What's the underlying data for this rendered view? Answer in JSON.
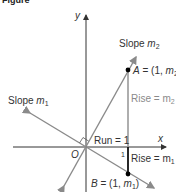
{
  "figure": {
    "caption_partial": "Figure",
    "axes": {
      "x_label": "x",
      "y_label": "y",
      "origin_label": "O"
    },
    "lines": [
      {
        "name": "line-m2",
        "label": "Slope m",
        "label_sub": "2",
        "color": "#8a8a8a"
      },
      {
        "name": "line-m1",
        "label": "Slope m",
        "label_sub": "1",
        "color": "#8a8a8a"
      }
    ],
    "points": {
      "A": {
        "label": "A = (1, m",
        "sub": "2",
        "close": ")"
      },
      "B": {
        "label": "B = (1, m",
        "sub": "1",
        "close": ")"
      }
    },
    "annotations": {
      "run": "Run = 1",
      "rise2": "Rise = m",
      "rise2_sub": "2",
      "rise1": "Rise = m",
      "rise1_sub": "1",
      "tick_one": "1"
    },
    "colors": {
      "axis": "#333333",
      "line_gray": "#8a8a8a",
      "segment_upper": "#9a9a9a",
      "segment_lower": "#111111",
      "point": "#000000"
    }
  }
}
